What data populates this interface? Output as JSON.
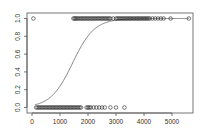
{
  "chart_data": {
    "type": "scatter",
    "title": "",
    "xlabel": "",
    "ylabel": "",
    "xlim": [
      -150,
      5800
    ],
    "ylim": [
      -0.03,
      1.06
    ],
    "grid": false,
    "legend": null,
    "x_ticks": [
      0,
      1000,
      2000,
      3000,
      4000,
      5000
    ],
    "x_tick_labels": [
      "0",
      "1000",
      "2000",
      "3000",
      "4000",
      "5000"
    ],
    "y_ticks": [
      0.0,
      0.2,
      0.4,
      0.6,
      0.8,
      1.0
    ],
    "y_tick_labels": [
      "0.0",
      "0.2",
      "0.4",
      "0.6",
      "0.8",
      "1.0"
    ],
    "series": [
      {
        "name": "observations_y1",
        "kind": "points",
        "marker": "open-circle",
        "y": 1,
        "x": [
          50,
          1480,
          1520,
          1560,
          1600,
          1650,
          1700,
          1750,
          1800,
          1850,
          1900,
          1950,
          2000,
          2050,
          2100,
          2150,
          2200,
          2250,
          2300,
          2350,
          2400,
          2450,
          2500,
          2550,
          2600,
          2650,
          2700,
          2750,
          2800,
          2900,
          3000,
          3050,
          3100,
          3150,
          3200,
          3250,
          3300,
          3350,
          3400,
          3450,
          3500,
          3550,
          3600,
          3650,
          3700,
          3750,
          3800,
          3850,
          3900,
          3950,
          4000,
          4050,
          4100,
          4150,
          4200,
          4300,
          4400,
          4500,
          4600,
          4700,
          4950,
          5600
        ]
      },
      {
        "name": "observations_y0",
        "kind": "points",
        "marker": "open-circle",
        "y": 0,
        "x": [
          150,
          200,
          250,
          300,
          350,
          400,
          450,
          500,
          550,
          600,
          650,
          700,
          750,
          800,
          850,
          900,
          950,
          1000,
          1050,
          1100,
          1150,
          1200,
          1250,
          1300,
          1350,
          1400,
          1450,
          1500,
          1550,
          1600,
          1650,
          1700,
          1750,
          1950,
          2000,
          2050,
          2100,
          2200,
          2300,
          2400,
          2500,
          2600,
          2800,
          3000,
          3300
        ]
      },
      {
        "name": "fitted_logistic",
        "kind": "line",
        "model": "logistic",
        "center": 1450,
        "scale": 390,
        "x_range": [
          100,
          5600
        ]
      }
    ]
  }
}
